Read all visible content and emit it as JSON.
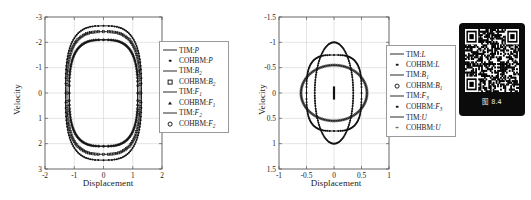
{
  "figure": {
    "caption": "图 8.4"
  },
  "panels": [
    {
      "id": "left",
      "xlabel": "Displacement",
      "ylabel": "Velocity",
      "xticks": [
        "-2",
        "-1",
        "0",
        "1",
        "2"
      ],
      "yticks": [
        "3",
        "2",
        "1",
        "0",
        "-1",
        "-2",
        "-3"
      ],
      "legend": [
        {
          "label": "TIM:",
          "italic": "P",
          "sub": "",
          "key": "line"
        },
        {
          "label": "COHBM:",
          "italic": "P",
          "sub": "",
          "key": "dot"
        },
        {
          "label": "TIM:",
          "italic": "B",
          "sub": "2",
          "key": "line"
        },
        {
          "label": "COHBM:",
          "italic": "B",
          "sub": "2",
          "key": "sq"
        },
        {
          "label": "TIM:",
          "italic": "F",
          "sub": "1",
          "key": "line"
        },
        {
          "label": "COHBM:",
          "italic": "F",
          "sub": "1",
          "key": "tri"
        },
        {
          "label": "TIM:",
          "italic": "F",
          "sub": "2",
          "key": "line"
        },
        {
          "label": "COHBM:",
          "italic": "F",
          "sub": "2",
          "key": "circ"
        }
      ]
    },
    {
      "id": "right",
      "xlabel": "Displacement",
      "ylabel": "Velocity",
      "xticks": [
        "-1",
        "-0.5",
        "0",
        "0.5",
        "1"
      ],
      "yticks": [
        "1.5",
        "1",
        "0.5",
        "0",
        "-0.5",
        "-1",
        "-1.5"
      ],
      "legend": [
        {
          "label": "TIM:",
          "italic": "L",
          "sub": "",
          "key": "line"
        },
        {
          "label": "COHBM:",
          "italic": "L",
          "sub": "",
          "key": "dot"
        },
        {
          "label": "TIM:",
          "italic": "B",
          "sub": "1",
          "key": "line"
        },
        {
          "label": "COHBM:",
          "italic": "B",
          "sub": "1",
          "key": "circ"
        },
        {
          "label": "TIM:",
          "italic": "F",
          "sub": "3",
          "key": "line"
        },
        {
          "label": "COHBM:",
          "italic": "F",
          "sub": "3",
          "key": "dot"
        },
        {
          "label": "TIM:",
          "italic": "U",
          "sub": "",
          "key": "line"
        },
        {
          "label": "COHBM:",
          "italic": "U",
          "sub": "",
          "key": "plus"
        }
      ]
    }
  ],
  "chart_data": [
    {
      "type": "line",
      "title": "",
      "xlabel": "Displacement",
      "ylabel": "Velocity",
      "xlim": [
        -2,
        2
      ],
      "ylim": [
        -3,
        3
      ],
      "xticks": [
        -2,
        -1,
        0,
        1,
        2
      ],
      "yticks": [
        -3,
        -2,
        -1,
        0,
        1,
        2,
        3
      ],
      "grid": true,
      "legend_position": "right-outside",
      "description": "Phase portraits (velocity vs displacement) of four nested closed periodic orbits; TIM solid lines overlaid with COHBM markers.",
      "series": [
        {
          "name": "TIM:P",
          "orbit": "rounded-rect",
          "rx": 1.3,
          "ry": 2.65,
          "exponent": 3.0,
          "style": "line"
        },
        {
          "name": "COHBM:P",
          "orbit": "rounded-rect",
          "rx": 1.3,
          "ry": 2.65,
          "exponent": 3.0,
          "style": "dot-markers"
        },
        {
          "name": "TIM:B2",
          "orbit": "rounded-rect",
          "rx": 1.25,
          "ry": 2.42,
          "exponent": 3.0,
          "style": "line"
        },
        {
          "name": "COHBM:B2",
          "orbit": "rounded-rect",
          "rx": 1.25,
          "ry": 2.42,
          "exponent": 3.0,
          "style": "square-markers"
        },
        {
          "name": "TIM:F1",
          "orbit": "rounded-rect",
          "rx": 1.17,
          "ry": 2.1,
          "exponent": 3.0,
          "style": "line"
        },
        {
          "name": "COHBM:F1",
          "orbit": "rounded-rect",
          "rx": 1.17,
          "ry": 2.1,
          "exponent": 3.0,
          "style": "triangle-markers"
        },
        {
          "name": "TIM:F2",
          "orbit": "rounded-rect",
          "rx": 1.17,
          "ry": 2.1,
          "exponent": 3.0,
          "style": "line"
        },
        {
          "name": "COHBM:F2",
          "orbit": "rounded-rect",
          "rx": 1.17,
          "ry": 2.1,
          "exponent": 3.0,
          "style": "circle-markers"
        }
      ]
    },
    {
      "type": "line",
      "title": "",
      "xlabel": "Displacement",
      "ylabel": "Velocity",
      "xlim": [
        -1,
        1
      ],
      "ylim": [
        -1.5,
        1.5
      ],
      "xticks": [
        -1,
        -0.5,
        0,
        0.5,
        1
      ],
      "yticks": [
        -1.5,
        -1,
        -0.5,
        0,
        0.5,
        1,
        1.5
      ],
      "grid": true,
      "legend_position": "right-outside",
      "description": "Phase portraits of four overlapping periodic orbits of differing aspect ratio, including a near-degenerate vertical segment at the origin.",
      "series": [
        {
          "name": "TIM:L",
          "orbit": "ellipse",
          "rx": 0.35,
          "ry": 1.0,
          "exponent": 2.0,
          "style": "line"
        },
        {
          "name": "COHBM:L",
          "orbit": "ellipse",
          "rx": 0.35,
          "ry": 1.0,
          "exponent": 2.0,
          "style": "dot-markers"
        },
        {
          "name": "TIM:B1",
          "orbit": "ellipse",
          "rx": 0.6,
          "ry": 0.55,
          "exponent": 2.0,
          "style": "line"
        },
        {
          "name": "COHBM:B1",
          "orbit": "ellipse",
          "rx": 0.6,
          "ry": 0.55,
          "exponent": 2.0,
          "style": "circle-markers"
        },
        {
          "name": "TIM:F3",
          "orbit": "rounded-rect",
          "rx": 0.5,
          "ry": 0.75,
          "exponent": 3.2,
          "style": "line"
        },
        {
          "name": "COHBM:F3",
          "orbit": "rounded-rect",
          "rx": 0.5,
          "ry": 0.75,
          "exponent": 3.2,
          "style": "dot-markers"
        },
        {
          "name": "TIM:U",
          "orbit": "segment",
          "rx": 0.012,
          "ry": 0.13,
          "exponent": 2.0,
          "style": "line"
        },
        {
          "name": "COHBM:U",
          "orbit": "segment",
          "rx": 0.012,
          "ry": 0.13,
          "exponent": 2.0,
          "style": "plus-markers"
        }
      ]
    }
  ]
}
